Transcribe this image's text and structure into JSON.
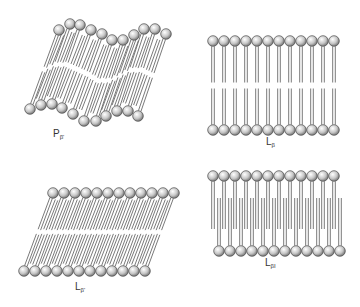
{
  "diagram": {
    "type": "lipid bilayer phases",
    "panels": [
      {
        "id": "p-beta-prime",
        "label_main": "P",
        "label_sub": "β'",
        "description": "ripple phase",
        "label_pos": [
          58,
          134
        ],
        "top_heads": [
          [
            59,
            30
          ],
          [
            70,
            24
          ],
          [
            80,
            25
          ],
          [
            91,
            30
          ],
          [
            102,
            34
          ],
          [
            112,
            40
          ],
          [
            123,
            40
          ],
          [
            134,
            35
          ],
          [
            144,
            29
          ],
          [
            155,
            29
          ],
          [
            166,
            34
          ]
        ],
        "bottom_heads": [
          [
            30,
            109
          ],
          [
            41,
            105
          ],
          [
            52,
            104
          ],
          [
            62,
            108
          ],
          [
            73,
            114
          ],
          [
            84,
            121
          ],
          [
            96,
            121
          ],
          [
            106,
            116
          ],
          [
            117,
            111
          ],
          [
            128,
            111
          ],
          [
            138,
            116
          ]
        ],
        "tilt": "tilted",
        "interdigitated": false
      },
      {
        "id": "l-beta",
        "label_main": "L",
        "label_sub": "β",
        "description": "gel phase, untilted",
        "label_pos": [
          268,
          141
        ],
        "top_heads_start": [
          213,
          41
        ],
        "bottom_heads_start": [
          213,
          130
        ],
        "count": 12,
        "spacing": 11,
        "tilt": "none",
        "interdigitated": false
      },
      {
        "id": "l-beta-prime",
        "label_main": "L",
        "label_sub": "β'",
        "description": "gel phase, tilted",
        "label_pos": [
          73,
          285
        ],
        "top_heads_start": [
          53,
          193
        ],
        "bottom_heads_start": [
          24,
          271
        ],
        "count": 12,
        "spacing": 11,
        "tilt": "tilted",
        "interdigitated": false
      },
      {
        "id": "l-beta-i",
        "label_main": "L",
        "label_sub": "βI",
        "description": "interdigitated gel phase",
        "label_pos": [
          268,
          262
        ],
        "top_heads_start": [
          213,
          176
        ],
        "bottom_heads_start": [
          219,
          251
        ],
        "count": 12,
        "spacing": 11,
        "tilt": "none",
        "interdigitated": true
      }
    ],
    "colors": {
      "background": "#ffffff",
      "head_light": "#ffffff",
      "head_dark": "#707070",
      "head_stroke": "#4a4a4a",
      "tail": "#6a6a6a",
      "label": "#333333"
    }
  }
}
